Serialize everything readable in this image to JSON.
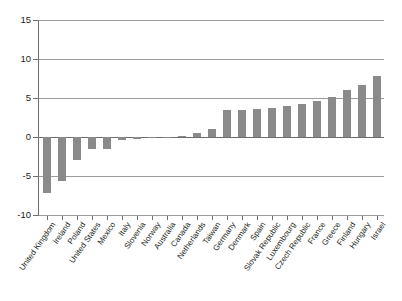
{
  "chart_data": {
    "type": "bar",
    "title": "",
    "subtitle": "",
    "xlabel": "",
    "ylabel": "",
    "ylim": [
      -10,
      15
    ],
    "yticks": [
      15,
      10,
      5,
      0,
      -5,
      -10
    ],
    "ytick_labels": [
      "15",
      "10",
      "5",
      "0",
      "-5",
      "-10"
    ],
    "grid": true,
    "legend": null,
    "bar_color": "#8a8a8a",
    "categories": [
      "United Kingdom",
      "Ireland",
      "Poland",
      "United States",
      "Mexico",
      "Italy",
      "Slovenia",
      "Norway",
      "Australia",
      "Canada",
      "Netherlands",
      "Taiwan",
      "Germany",
      "Denmark",
      "Spain",
      "Slovak Republic",
      "Luxembourg",
      "Czech Republic",
      "France",
      "Greece",
      "Finland",
      "Hungary",
      "Israel"
    ],
    "values": [
      -7.2,
      -5.6,
      -2.9,
      -1.6,
      -1.5,
      -0.4,
      -0.2,
      -0.1,
      -0.1,
      0.1,
      0.5,
      1.0,
      3.4,
      3.5,
      3.6,
      3.7,
      4.0,
      4.2,
      4.6,
      5.1,
      6.0,
      6.7,
      7.8
    ]
  }
}
